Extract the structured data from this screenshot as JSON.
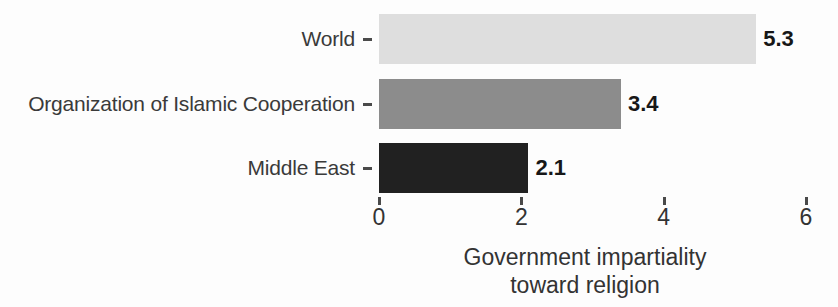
{
  "chart_data": {
    "type": "bar",
    "orientation": "horizontal",
    "title": "",
    "subtitle": "",
    "xlabel": "Government impartiality toward religion",
    "xlabel_lines": [
      "Government impartiality",
      "toward religion"
    ],
    "ylabel": "",
    "categories": [
      "World",
      "Organization of Islamic Cooperation",
      "Middle East"
    ],
    "values": [
      5.3,
      3.4,
      2.1
    ],
    "value_labels": [
      "5.3",
      "3.4",
      "2.1"
    ],
    "bar_colors": [
      "#dedede",
      "#8c8c8c",
      "#212121"
    ],
    "xlim": [
      0,
      6
    ],
    "xticks": [
      0,
      2,
      4,
      6
    ],
    "xtick_labels": [
      "0",
      "2",
      "4",
      "6"
    ],
    "grid": false,
    "legend": false,
    "legend_position": "none",
    "background_color": "#fdfdfd",
    "text_color": "#333333"
  },
  "axis": {
    "x_title_line1": "Government impartiality",
    "x_title_line2": "toward religion"
  },
  "bars": [
    {
      "label": "World",
      "value": 5.3,
      "value_label": "5.3",
      "color": "#dedede"
    },
    {
      "label": "Organization of Islamic Cooperation",
      "value": 3.4,
      "value_label": "3.4",
      "color": "#8c8c8c"
    },
    {
      "label": "Middle East",
      "value": 2.1,
      "value_label": "2.1",
      "color": "#212121"
    }
  ],
  "ticks": [
    {
      "label": "0",
      "value": 0
    },
    {
      "label": "2",
      "value": 2
    },
    {
      "label": "4",
      "value": 4
    },
    {
      "label": "6",
      "value": 6
    }
  ]
}
